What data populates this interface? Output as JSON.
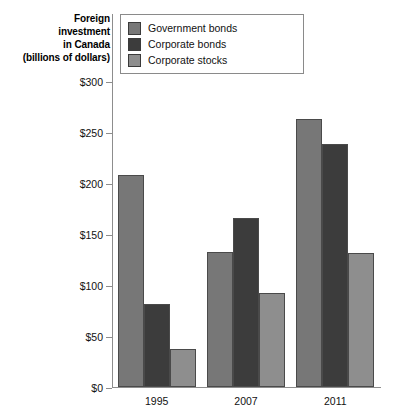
{
  "axis_title": {
    "lines": [
      "Foreign",
      "investment",
      "in Canada",
      "(billions of dollars)"
    ]
  },
  "legend": {
    "items": [
      {
        "label": "Government bonds",
        "color": "#777777"
      },
      {
        "label": "Corporate bonds",
        "color": "#3c3c3c"
      },
      {
        "label": "Corporate stocks",
        "color": "#8e8e8e"
      }
    ]
  },
  "chart_data": {
    "type": "bar",
    "title": "",
    "xlabel": "",
    "ylabel": "Foreign investment in Canada (billions of dollars)",
    "categories": [
      "1995",
      "2007",
      "2011"
    ],
    "series": [
      {
        "name": "Government bonds",
        "color": "#777777",
        "values": [
          208,
          132,
          263
        ]
      },
      {
        "name": "Corporate bonds",
        "color": "#3c3c3c",
        "values": [
          81,
          166,
          238
        ]
      },
      {
        "name": "Corporate stocks",
        "color": "#8e8e8e",
        "values": [
          37,
          92,
          131
        ]
      }
    ],
    "ylim": [
      0,
      300
    ],
    "yticks": [
      0,
      50,
      100,
      150,
      200,
      250,
      300
    ],
    "ytick_labels": [
      "$0",
      "$50",
      "$100",
      "$150",
      "$200",
      "$250",
      "$300"
    ],
    "grid": false,
    "legend_position": "top"
  }
}
